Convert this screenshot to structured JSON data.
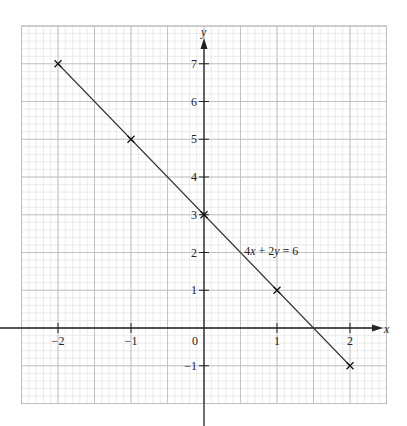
{
  "chart_data": {
    "type": "line",
    "title": "",
    "xlabel": "x",
    "ylabel": "y",
    "xlim": [
      -2.5,
      2.5
    ],
    "ylim": [
      -2,
      8
    ],
    "grid": true,
    "grid_minor_x_step": 0.1,
    "grid_major_x_step": 0.5,
    "grid_minor_y_step": 0.2,
    "grid_major_y_step": 1,
    "x_ticks": [
      -2,
      -1,
      1,
      2
    ],
    "x_tick_labels": [
      "−2",
      "−1",
      "1",
      "2"
    ],
    "y_ticks": [
      -1,
      1,
      2,
      3,
      4,
      5,
      6,
      7
    ],
    "y_tick_labels": [
      "−1",
      "1",
      "2",
      "3",
      "4",
      "5",
      "6",
      "7"
    ],
    "origin_label": "0",
    "series": [
      {
        "name": "4x + 2y = 6",
        "x": [
          -2,
          -1,
          0,
          1,
          2
        ],
        "y": [
          7,
          5,
          3,
          1,
          -1
        ],
        "marker": "x",
        "color": "#333333"
      }
    ],
    "annotations": [
      {
        "text": "4x + 2y = 6",
        "x": 0.55,
        "y": 2.05
      }
    ]
  },
  "labels": {
    "x_axis": "x",
    "y_axis": "y",
    "equation_prefix": "4",
    "equation_x": "x",
    "equation_mid": " + 2",
    "equation_y": "y",
    "equation_suffix": " = 6"
  },
  "colors": {
    "grid_minor": "#e2e2e2",
    "grid_major": "#bdbdbd",
    "axis": "#222222",
    "line": "#333333"
  }
}
